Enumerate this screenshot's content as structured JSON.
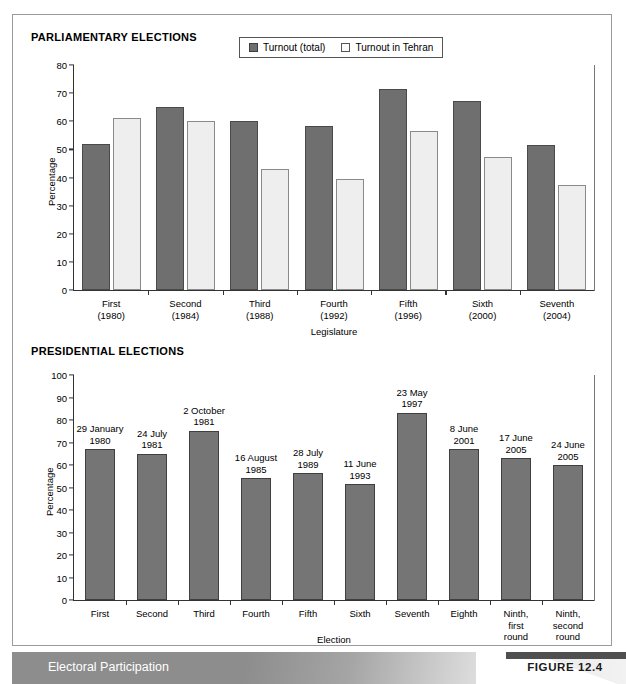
{
  "figure": {
    "caption": "Electoral Participation",
    "figure_tag": "FIGURE 12.4"
  },
  "panels": {
    "top_title": "PARLIAMENTARY ELECTIONS",
    "bottom_title": "PRESIDENTIAL ELECTIONS"
  },
  "colors": {
    "dark_bar": "#6f6f6f",
    "light_bar": "#eeeeee",
    "solid_bar": "#757575",
    "axis": "#333333",
    "caption_band": "#8d8d8d"
  },
  "chart_data": [
    {
      "id": "parliamentary",
      "type": "bar",
      "title": "PARLIAMENTARY ELECTIONS",
      "xlabel": "Legislature",
      "ylabel": "Percentage",
      "ylim": [
        0,
        80
      ],
      "yticks": [
        0,
        10,
        20,
        30,
        40,
        50,
        60,
        70,
        80
      ],
      "grid": false,
      "legend_position": "top-center",
      "categories": [
        "First\n(1980)",
        "Second\n(1984)",
        "Third\n(1988)",
        "Fourth\n(1992)",
        "Fifth\n(1996)",
        "Sixth\n(2000)",
        "Seventh\n(2004)"
      ],
      "series": [
        {
          "name": "Turnout (total)",
          "values": [
            52.0,
            65.0,
            60.2,
            58.2,
            71.5,
            67.3,
            51.5
          ]
        },
        {
          "name": "Turnout in Tehran",
          "values": [
            61.0,
            60.0,
            43.2,
            39.3,
            56.4,
            47.4,
            37.3
          ]
        }
      ]
    },
    {
      "id": "presidential",
      "type": "bar",
      "title": "PRESIDENTIAL ELECTIONS",
      "xlabel": "Election",
      "ylabel": "Percentage",
      "ylim": [
        0,
        100
      ],
      "yticks": [
        0,
        10,
        20,
        30,
        40,
        50,
        60,
        70,
        80,
        90,
        100
      ],
      "grid": false,
      "legend_position": "none",
      "categories": [
        "First",
        "Second",
        "Third",
        "Fourth",
        "Fifth",
        "Sixth",
        "Seventh",
        "Eighth",
        "Ninth,\nfirst\nround",
        "Ninth,\nsecond\nround"
      ],
      "annotations": [
        "29 January\n1980",
        "24 July\n1981",
        "2 October\n1981",
        "16 August\n1985",
        "28 July\n1989",
        "11 June\n1993",
        "23 May\n1997",
        "8 June\n2001",
        "17 June\n2005",
        "24 June\n2005"
      ],
      "series": [
        {
          "name": "Turnout",
          "values": [
            67.0,
            65.1,
            75.2,
            54.2,
            56.3,
            51.4,
            83.2,
            67.0,
            63.0,
            60.0
          ]
        }
      ]
    }
  ]
}
